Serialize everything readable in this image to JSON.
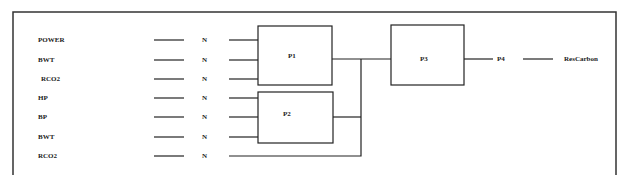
{
  "diagram": {
    "inputs": [
      {
        "label": "POWER",
        "node": "N",
        "target": "P1"
      },
      {
        "label": "BWT",
        "node": "N",
        "target": "P1"
      },
      {
        "label": "RCO2",
        "node": "N",
        "target": "P1"
      },
      {
        "label": "HP",
        "node": "N",
        "target": "P2"
      },
      {
        "label": "BP",
        "node": "N",
        "target": "P2"
      },
      {
        "label": "BWT",
        "node": "N",
        "target": "P2"
      },
      {
        "label": "RCO2",
        "node": "N",
        "target": "P3"
      }
    ],
    "processes": {
      "p1": "P1",
      "p2": "P2",
      "p3": "P3",
      "p4": "P4"
    },
    "output": "ResCarbon",
    "edges": [
      [
        "P1",
        "P3"
      ],
      [
        "P2",
        "P3"
      ],
      [
        "RCO2",
        "P3"
      ],
      [
        "P3",
        "P4"
      ],
      [
        "P4",
        "ResCarbon"
      ]
    ]
  }
}
